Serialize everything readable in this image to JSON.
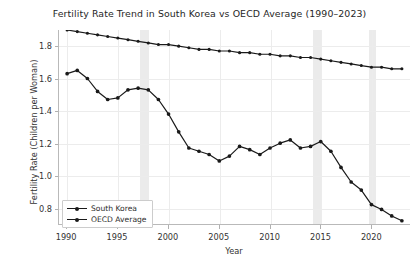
{
  "chart_data": {
    "type": "line",
    "title": "Fertility Rate Trend in South Korea vs OECD Average (1990–2023)",
    "xlabel": "Year",
    "ylabel": "Fertility Rate (Children per Woman)",
    "xlim": [
      1989.2,
      2023.8
    ],
    "ylim": [
      0.7,
      1.9
    ],
    "grid": true,
    "legend_position": "lower-left",
    "xticks": [
      1990,
      1995,
      2000,
      2005,
      2010,
      2015,
      2020
    ],
    "xtick_labels": [
      "1990",
      "1995",
      "2000",
      "2005",
      "2010",
      "2015",
      "2020"
    ],
    "yticks": [
      0.8,
      1.0,
      1.2,
      1.4,
      1.6,
      1.8
    ],
    "ytick_labels": [
      "0.8",
      "1.0",
      "1.2",
      "1.4",
      "1.6",
      "1.8"
    ],
    "x": [
      1990,
      1991,
      1992,
      1993,
      1994,
      1995,
      1996,
      1997,
      1998,
      1999,
      2000,
      2001,
      2002,
      2003,
      2004,
      2005,
      2006,
      2007,
      2008,
      2009,
      2010,
      2011,
      2012,
      2013,
      2014,
      2015,
      2016,
      2017,
      2018,
      2019,
      2020,
      2021,
      2022,
      2023
    ],
    "series": [
      {
        "name": "South Korea",
        "color": "#1a1a1a",
        "marker": "circle",
        "values": [
          1.63,
          1.65,
          1.6,
          1.52,
          1.47,
          1.48,
          1.53,
          1.54,
          1.53,
          1.47,
          1.38,
          1.27,
          1.17,
          1.15,
          1.13,
          1.09,
          1.12,
          1.18,
          1.16,
          1.13,
          1.17,
          1.2,
          1.22,
          1.17,
          1.18,
          1.21,
          1.15,
          1.05,
          0.96,
          0.91,
          0.82,
          0.79,
          0.75,
          0.72
        ]
      },
      {
        "name": "OECD Average",
        "color": "#1a1a1a",
        "marker": "circle",
        "values": [
          1.9,
          1.89,
          1.88,
          1.87,
          1.86,
          1.85,
          1.84,
          1.83,
          1.82,
          1.81,
          1.81,
          1.8,
          1.79,
          1.78,
          1.78,
          1.77,
          1.77,
          1.76,
          1.76,
          1.75,
          1.75,
          1.74,
          1.74,
          1.73,
          1.73,
          1.72,
          1.71,
          1.7,
          1.69,
          1.68,
          1.67,
          1.67,
          1.66,
          1.66
        ]
      }
    ],
    "highlight_bands": [
      {
        "start": 1997.2,
        "end": 1998.0
      },
      {
        "start": 2014.2,
        "end": 2015.0
      },
      {
        "start": 2019.7,
        "end": 2020.4
      }
    ]
  }
}
